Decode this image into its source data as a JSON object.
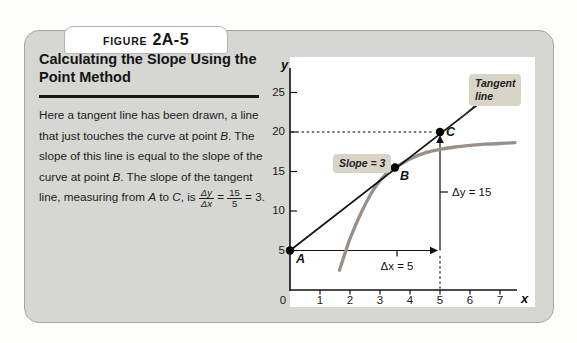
{
  "figure": {
    "tab": {
      "prefix": "FIGURE",
      "number": "2A-5"
    },
    "title_lines": [
      "Calculating the Slope Using the",
      "Point Method"
    ],
    "caption_runs": [
      {
        "text": "Here a tangent line has been drawn, a line that just touches the curve at point "
      },
      {
        "text": "B",
        "italic": true
      },
      {
        "text": ". The slope of this line is equal to the slope of the curve at point "
      },
      {
        "text": "B",
        "italic": true
      },
      {
        "text": ". The slope of the tangent line, measuring from "
      },
      {
        "text": "A",
        "italic": true
      },
      {
        "text": " to "
      },
      {
        "text": "C",
        "italic": true
      },
      {
        "text": ", is "
      },
      {
        "fraction": {
          "numerator": "Δy",
          "denominator": "Δx",
          "italic": true
        }
      },
      {
        "text": " = "
      },
      {
        "fraction": {
          "numerator": "15",
          "denominator": "5",
          "italic": false
        }
      },
      {
        "text": " = 3."
      }
    ],
    "colors": {
      "card_background": "#d6d6d3",
      "panel_background": "#ffffff",
      "annotation_box": "#d9d4c8"
    }
  },
  "chart_data": {
    "type": "line",
    "title": "",
    "xlabel": "x",
    "ylabel": "y",
    "xlim": [
      0,
      7.8
    ],
    "ylim": [
      0,
      29
    ],
    "x_ticks": [
      0,
      1,
      2,
      3,
      4,
      5,
      6,
      7
    ],
    "y_ticks": [
      5,
      10,
      15,
      20,
      25
    ],
    "grid": false,
    "series": [
      {
        "name": "curve",
        "color": "#9a9088",
        "stroke_width": 3.3,
        "points": [
          [
            1.65,
            2.5
          ],
          [
            2.0,
            6.5
          ],
          [
            2.4,
            10.0
          ],
          [
            2.8,
            12.8
          ],
          [
            3.2,
            14.7
          ],
          [
            3.5,
            15.5
          ],
          [
            4.0,
            16.6
          ],
          [
            4.5,
            17.35
          ],
          [
            5.0,
            17.8
          ],
          [
            5.5,
            18.1
          ],
          [
            6.0,
            18.3
          ],
          [
            6.5,
            18.45
          ],
          [
            7.0,
            18.55
          ],
          [
            7.5,
            18.65
          ]
        ]
      },
      {
        "name": "tangent-line",
        "color": "#111111",
        "stroke_width": 1.7,
        "points": [
          [
            0,
            5
          ],
          [
            6.27,
            23.5
          ]
        ]
      }
    ],
    "points": [
      {
        "label": "A",
        "x": 0,
        "y": 5
      },
      {
        "label": "B",
        "x": 3.5,
        "y": 15.5
      },
      {
        "label": "C",
        "x": 5,
        "y": 20
      }
    ],
    "annotations": {
      "slope_label": "Slope = 3",
      "tangent_label": "Tangent line",
      "dx_label": "Δx = 5",
      "dy_label": "Δy = 15"
    },
    "guides": {
      "dotted_horizontal_y": 20,
      "dotted_vertical_x": 5,
      "dx_arrow_y": 5,
      "dy_arrow_x": 5
    }
  }
}
